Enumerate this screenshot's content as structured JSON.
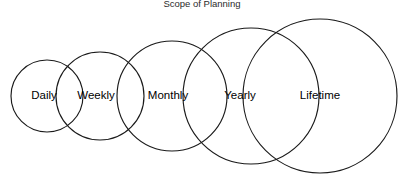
{
  "diagram": {
    "title": "Scope of Planning",
    "type": "nested-overlapping-circles",
    "background_color": "#ffffff",
    "stroke_color": "#1a1a1a",
    "label_color": "#000000",
    "width": 404,
    "height": 185,
    "title_x": 202,
    "title_y": 7,
    "circles": [
      {
        "label": "Daily",
        "cx": 47,
        "cy": 96,
        "r": 36,
        "label_x": 44,
        "label_y": 96
      },
      {
        "label": "Weekly",
        "cx": 100,
        "cy": 96,
        "r": 44,
        "label_x": 96,
        "label_y": 96
      },
      {
        "label": "Monthly",
        "cx": 172,
        "cy": 96,
        "r": 55,
        "label_x": 168,
        "label_y": 96
      },
      {
        "label": "Yearly",
        "cx": 251,
        "cy": 96,
        "r": 68,
        "label_x": 240,
        "label_y": 96
      },
      {
        "label": "Lifetime",
        "cx": 320,
        "cy": 96,
        "r": 77,
        "label_x": 320,
        "label_y": 96
      }
    ]
  }
}
